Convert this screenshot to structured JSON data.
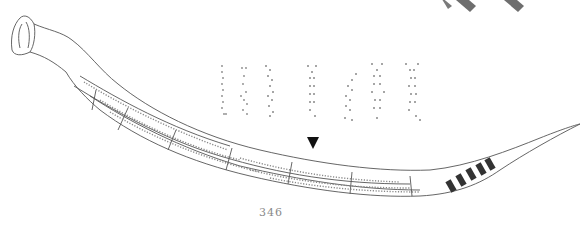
{
  "page": {
    "page_number": "346",
    "marker_glyph": "▼",
    "colors": {
      "line": "#555555",
      "dots": "#888888",
      "marker": "#111111",
      "diamonds": "#6e6e6e",
      "page_number": "#8a8a8a"
    }
  },
  "figure": {
    "glyph_columns": 7,
    "banded_section_count": 5
  }
}
